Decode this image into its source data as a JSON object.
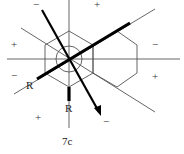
{
  "figure": {
    "caption": "7c",
    "labels": {
      "r_left": "R",
      "r_bottom": "R"
    },
    "signs": [
      {
        "id": "top-left",
        "text": "−"
      },
      {
        "id": "top-right",
        "text": "+"
      },
      {
        "id": "left-upper",
        "text": "+"
      },
      {
        "id": "right-upper",
        "text": "−"
      },
      {
        "id": "left-lower",
        "text": "−"
      },
      {
        "id": "right-lower",
        "text": "+"
      },
      {
        "id": "bottom-left",
        "text": "+"
      },
      {
        "id": "bottom-right",
        "text": "−"
      }
    ],
    "colors": {
      "thin_line": "#555555",
      "bold_line": "#000000",
      "background": "#ffffff"
    }
  }
}
